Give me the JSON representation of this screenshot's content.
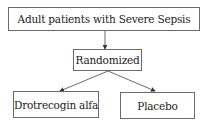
{
  "diagram": {
    "type": "flowchart",
    "nodes": [
      {
        "id": "population",
        "label": "Adult patients with Severe Sepsis"
      },
      {
        "id": "randomized",
        "label": "Randomized"
      },
      {
        "id": "treatment",
        "label": "Drotrecogin alfa"
      },
      {
        "id": "control",
        "label": "Placebo"
      }
    ],
    "edges": [
      {
        "from": "population",
        "to": "randomized"
      },
      {
        "from": "randomized",
        "to": "treatment"
      },
      {
        "from": "randomized",
        "to": "control"
      }
    ]
  }
}
